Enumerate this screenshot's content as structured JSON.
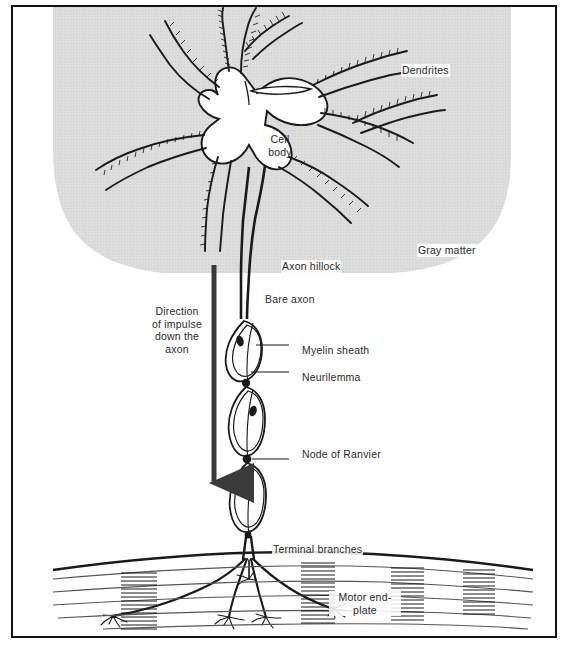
{
  "figure": {
    "kind": "anatomical-diagram",
    "colors": {
      "frame": "#111111",
      "ink": "#1a1a1a",
      "gray_matter_fill": "#dcdcdc",
      "label_text": "#2b2b2b",
      "arrow": "#3a3a3a",
      "muscle_line": "#4a4a4a"
    }
  },
  "labels": {
    "dendrites": "Dendrites",
    "cell_body": "Cell\nbody",
    "gray_matter": "Gray matter",
    "axon_hillock": "Axon hillock",
    "bare_axon": "Bare axon",
    "myelin_sheath": "Myelin sheath",
    "neurilemma": "Neurilemma",
    "node_of_ranvier": "Node of Ranvier",
    "direction_of_impulse": "Direction\nof impulse\ndown the\naxon",
    "terminal_branches": "Terminal branches",
    "motor_end_plate": "Motor end-\nplate"
  },
  "structures": {
    "gray_matter_region": {
      "description": "Large light-gray rounded region occupying upper portion, curving down at left and right"
    },
    "cell_body": {
      "description": "White irregular soma with nucleus slit near top center"
    },
    "dendrites": {
      "count": 7,
      "description": "Hatched tapering branches radiating from soma upward, left and right"
    },
    "axon": {
      "description": "Single long process descending from axon hillock through bare axon to myelinated region"
    },
    "myelin_segments": {
      "count": 3,
      "description": "Elliptical internodes each containing a dark Schwann cell nucleus"
    },
    "nodes_of_ranvier": {
      "count": 3,
      "description": "Dark constriction dots between myelin internodes"
    },
    "terminal_branches": {
      "count": 5,
      "description": "Axon splays into terminal branches that end in motor end-plates"
    },
    "muscle_fibers": {
      "description": "Horizontal fiber lines with four dense vertical striation bands"
    },
    "impulse_arrow": {
      "direction": "downward",
      "description": "Thick vertical arrow with solid arrowhead at bottom"
    }
  }
}
